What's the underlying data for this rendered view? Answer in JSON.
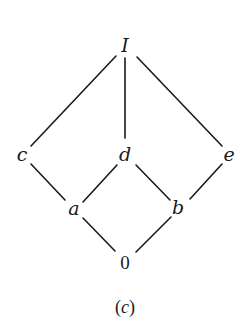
{
  "diagram": {
    "type": "hasse-diagram",
    "caption": "(c)",
    "caption_parts": {
      "open": "(",
      "letter": "c",
      "close": ")"
    },
    "nodes": [
      {
        "id": "I",
        "label": "I",
        "x": 125,
        "y": 52
      },
      {
        "id": "c",
        "label": "c",
        "x": 22,
        "y": 160
      },
      {
        "id": "d",
        "label": "d",
        "x": 125,
        "y": 160
      },
      {
        "id": "e",
        "label": "e",
        "x": 229,
        "y": 160
      },
      {
        "id": "a",
        "label": "a",
        "x": 74,
        "y": 214
      },
      {
        "id": "b",
        "label": "b",
        "x": 178,
        "y": 214
      },
      {
        "id": "0",
        "label": "0",
        "x": 125,
        "y": 268
      }
    ],
    "edges": [
      {
        "from": "I",
        "to": "c"
      },
      {
        "from": "I",
        "to": "d"
      },
      {
        "from": "I",
        "to": "e"
      },
      {
        "from": "c",
        "to": "a"
      },
      {
        "from": "d",
        "to": "a"
      },
      {
        "from": "d",
        "to": "b"
      },
      {
        "from": "e",
        "to": "b"
      },
      {
        "from": "a",
        "to": "0"
      },
      {
        "from": "b",
        "to": "0"
      }
    ]
  }
}
